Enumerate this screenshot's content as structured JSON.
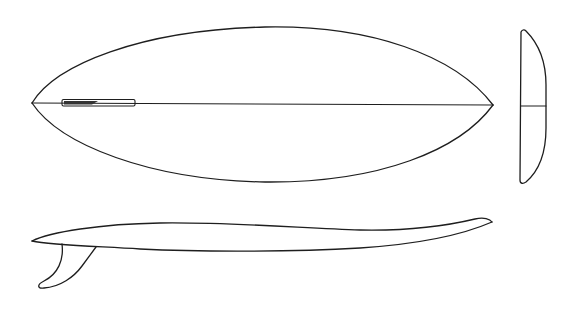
{
  "figure": {
    "colors": {
      "stroke": "#1e1e1e",
      "background": "#ffffff"
    },
    "views": [
      {
        "id": "plan-view",
        "label": "Top plan view with stringer and fin box"
      },
      {
        "id": "cross-section-view",
        "label": "End cross-section view"
      },
      {
        "id": "side-profile-view",
        "label": "Side profile with fin"
      }
    ]
  }
}
